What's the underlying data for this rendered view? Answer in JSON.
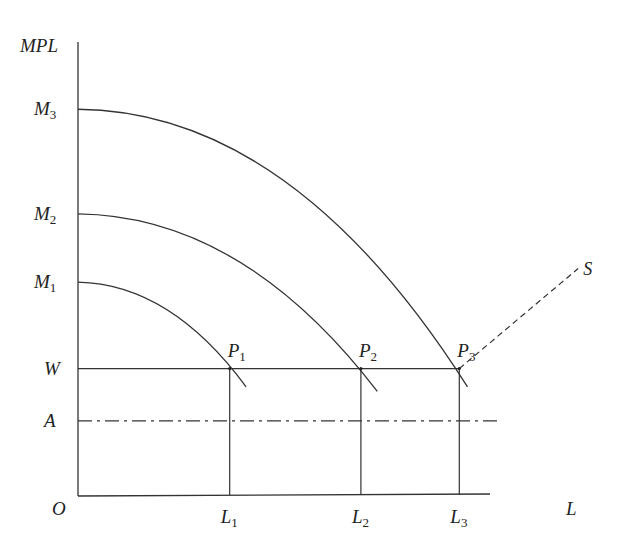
{
  "chart_data": {
    "type": "line",
    "title": "",
    "xlabel": "L",
    "ylabel": "MPL",
    "origin_label": "O",
    "xlim": [
      0,
      10
    ],
    "ylim": [
      0,
      10
    ],
    "grid": false,
    "y_levels": [
      {
        "name": "M3",
        "base": "M",
        "sub": "3",
        "value": 8.5
      },
      {
        "name": "M2",
        "base": "M",
        "sub": "2",
        "value": 6.2
      },
      {
        "name": "M1",
        "base": "M",
        "sub": "1",
        "value": 4.7
      },
      {
        "name": "W",
        "base": "W",
        "sub": "",
        "value": 2.8
      },
      {
        "name": "A",
        "base": "A",
        "sub": "",
        "value": 1.65
      }
    ],
    "x_levels": [
      {
        "name": "L1",
        "base": "L",
        "sub": "1",
        "value": 3.7
      },
      {
        "name": "L2",
        "base": "L",
        "sub": "2",
        "value": 6.9
      },
      {
        "name": "L3",
        "base": "L",
        "sub": "3",
        "value": 9.3
      }
    ],
    "series": [
      {
        "name": "MPL1",
        "style": "solid",
        "start_level": "M1",
        "end_x": 4.1,
        "end_y": 2.4
      },
      {
        "name": "MPL2",
        "style": "solid",
        "start_level": "M2",
        "end_x": 7.3,
        "end_y": 2.3
      },
      {
        "name": "MPL3",
        "style": "solid",
        "start_level": "M3",
        "end_x": 9.5,
        "end_y": 2.4
      },
      {
        "name": "W",
        "style": "solid",
        "from_x": 0,
        "to_x": 9.3,
        "level": "W"
      },
      {
        "name": "A",
        "style": "dash-dot",
        "from_x": 0,
        "to_x": 10.3,
        "level": "A"
      },
      {
        "name": "S",
        "style": "dashed",
        "points": [
          [
            9.3,
            2.8
          ],
          [
            12.2,
            5.0
          ]
        ],
        "label": "S"
      }
    ],
    "points": [
      {
        "name": "P1",
        "base": "P",
        "sub": "1",
        "x": 3.7,
        "y": 2.8
      },
      {
        "name": "P2",
        "base": "P",
        "sub": "2",
        "x": 6.9,
        "y": 2.8
      },
      {
        "name": "P3",
        "base": "P",
        "sub": "3",
        "x": 9.3,
        "y": 2.8
      }
    ]
  }
}
